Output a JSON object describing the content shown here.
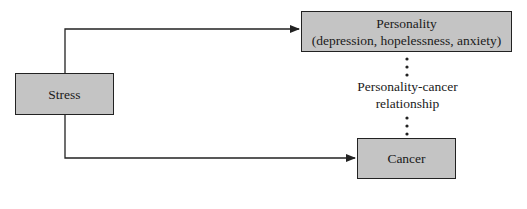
{
  "diagram": {
    "nodes": {
      "stress": {
        "label": "Stress"
      },
      "personality": {
        "title": "Personality",
        "subtitle": "(depression, hopelessness, anxiety)"
      },
      "cancer": {
        "label": "Cancer"
      }
    },
    "relationship": {
      "line1": "Personality-cancer",
      "line2": "relationship"
    },
    "edges": [
      {
        "from": "Stress",
        "to": "Personality",
        "style": "solid-arrow"
      },
      {
        "from": "Stress",
        "to": "Cancer",
        "style": "solid-arrow"
      },
      {
        "from": "Personality",
        "to": "Cancer",
        "style": "dotted",
        "label": "Personality-cancer relationship"
      }
    ],
    "colors": {
      "box_fill": "#c4c4c4",
      "stroke": "#222222"
    }
  }
}
